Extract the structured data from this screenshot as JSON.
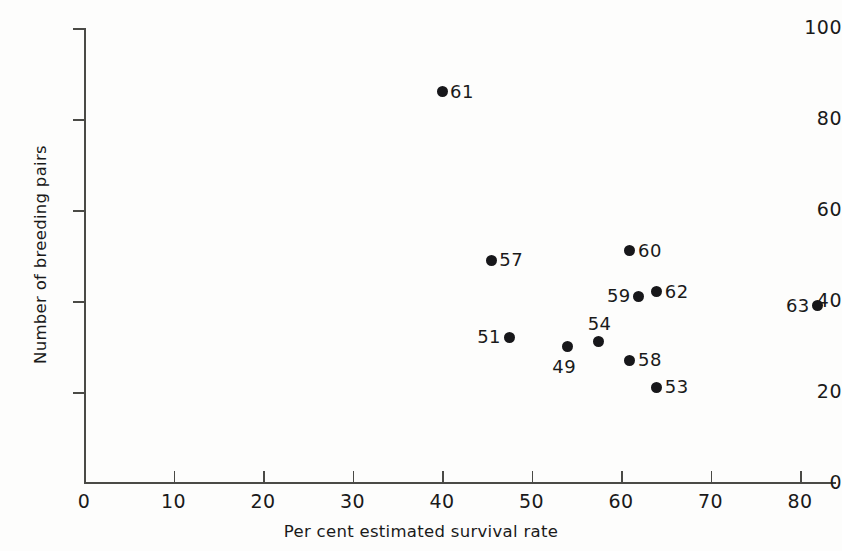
{
  "chart_data": {
    "type": "scatter",
    "title": "",
    "xlabel": "Per cent estimated survival rate",
    "ylabel": "Number of breeding pairs",
    "xlim": [
      0,
      84
    ],
    "ylim": [
      0,
      100
    ],
    "xticks": [
      0,
      10,
      20,
      30,
      40,
      50,
      60,
      70,
      80
    ],
    "xtick_labels": [
      "0",
      "10",
      "20",
      "30",
      "40",
      "50",
      "60",
      "70",
      "80"
    ],
    "yticks": [
      0,
      20,
      40,
      60,
      80,
      100
    ],
    "ytick_labels": [
      "0",
      "20",
      "40",
      "60",
      "80",
      "100"
    ],
    "grid": false,
    "legend": "none",
    "marker_color": "#17171a",
    "axis_color": "#4a4a46",
    "points": [
      {
        "label": "61",
        "x": 40.0,
        "y": 86,
        "label_pos": "right"
      },
      {
        "label": "57",
        "x": 45.5,
        "y": 49,
        "label_pos": "right"
      },
      {
        "label": "60",
        "x": 61.0,
        "y": 51,
        "label_pos": "right"
      },
      {
        "label": "59",
        "x": 62.0,
        "y": 41,
        "label_pos": "left"
      },
      {
        "label": "62",
        "x": 64.0,
        "y": 42,
        "label_pos": "right"
      },
      {
        "label": "63",
        "x": 82.0,
        "y": 39,
        "label_pos": "left"
      },
      {
        "label": "51",
        "x": 47.5,
        "y": 32,
        "label_pos": "left"
      },
      {
        "label": "54",
        "x": 57.5,
        "y": 31,
        "label_pos": "above"
      },
      {
        "label": "49",
        "x": 54.0,
        "y": 30,
        "label_pos": "below-left"
      },
      {
        "label": "58",
        "x": 61.0,
        "y": 27,
        "label_pos": "right"
      },
      {
        "label": "53",
        "x": 64.0,
        "y": 21,
        "label_pos": "right"
      }
    ]
  }
}
